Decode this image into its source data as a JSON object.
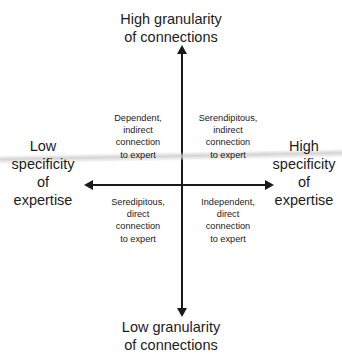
{
  "chart_data": {
    "type": "diagram",
    "subtype": "2x2-matrix",
    "title": "",
    "axes": {
      "vertical": {
        "top_label": [
          "High granularity",
          "of connections"
        ],
        "bottom_label": [
          "Low granularity",
          "of connections"
        ]
      },
      "horizontal": {
        "left_label": [
          "Low",
          "specificity",
          "of",
          "expertise"
        ],
        "right_label": [
          "High",
          "specificity",
          "of",
          "expertise"
        ]
      }
    },
    "quadrants": [
      {
        "position": "top-left",
        "lines": [
          "Dependent,",
          "indirect",
          "connection",
          "to expert"
        ]
      },
      {
        "position": "top-right",
        "lines": [
          "Serendipitous,",
          "indirect",
          "connection",
          "to expert"
        ]
      },
      {
        "position": "bottom-left",
        "lines": [
          "Seredipitous,",
          "direct",
          "connection",
          "to expert"
        ]
      },
      {
        "position": "bottom-right",
        "lines": [
          "Independent,",
          "direct",
          "connection",
          "to expert"
        ]
      }
    ]
  },
  "colors": {
    "background": "#ffffff",
    "axis": "#1a1a1a",
    "axis_label_text": "#1c1c1c",
    "quadrant_text": "#222222",
    "artifact_line": "#cdcdcd"
  },
  "labels": {
    "top_line1": "High granularity",
    "top_line2": "of connections",
    "bottom_line1": "Low granularity",
    "bottom_line2": "of connections",
    "left_line1": "Low",
    "left_line2": "specificity",
    "left_line3": "of",
    "left_line4": "expertise",
    "right_line1": "High",
    "right_line2": "specificity",
    "right_line3": "of",
    "right_line4": "expertise"
  },
  "quadrant_text": {
    "top_left": {
      "line1": "Dependent,",
      "line2": "indirect",
      "line3": "connection",
      "line4": "to expert"
    },
    "top_right": {
      "line1": "Serendipitous,",
      "line2": "indirect",
      "line3": "connection",
      "line4": "to expert"
    },
    "bottom_left": {
      "line1": "Seredipitous,",
      "line2": "direct",
      "line3": "connection",
      "line4": "to expert"
    },
    "bottom_right": {
      "line1": "Independent,",
      "line2": "direct",
      "line3": "connection",
      "line4": "to expert"
    }
  }
}
